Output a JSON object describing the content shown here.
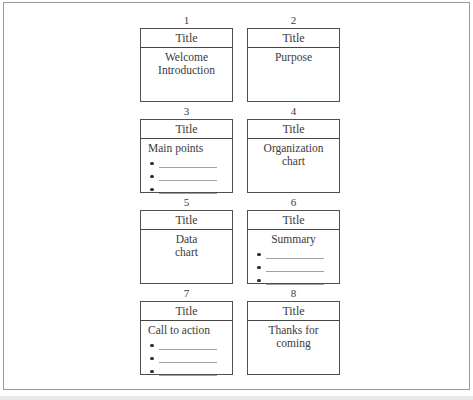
{
  "figure": {
    "slides": [
      {
        "number": "1",
        "title_label": "Title",
        "body_lines": [
          "Welcome",
          "Introduction"
        ],
        "body_align": "center",
        "bullet_count": 0
      },
      {
        "number": "2",
        "title_label": "Title",
        "body_lines": [
          "Purpose"
        ],
        "body_align": "center",
        "bullet_count": 0
      },
      {
        "number": "3",
        "title_label": "Title",
        "body_lines": [
          "Main points"
        ],
        "body_align": "left",
        "bullet_count": 3
      },
      {
        "number": "4",
        "title_label": "Title",
        "body_lines": [
          "Organization",
          "chart"
        ],
        "body_align": "center",
        "bullet_count": 0
      },
      {
        "number": "5",
        "title_label": "Title",
        "body_lines": [
          "Data",
          "chart"
        ],
        "body_align": "center",
        "bullet_count": 0
      },
      {
        "number": "6",
        "title_label": "Title",
        "body_lines": [
          "Summary"
        ],
        "body_align": "center",
        "bullet_count": 3
      },
      {
        "number": "7",
        "title_label": "Title",
        "body_lines": [
          "Call to action"
        ],
        "body_align": "left",
        "bullet_count": 3
      },
      {
        "number": "8",
        "title_label": "Title",
        "body_lines": [
          "Thanks for",
          "coming"
        ],
        "body_align": "center",
        "bullet_count": 0
      }
    ],
    "icons": {
      "bullet": "•"
    },
    "colors": {
      "background": "#ffffff",
      "frame_border": "#9a9a9a",
      "box_border": "#4e4e4e",
      "text": "#3b3b3b",
      "blank_line": "#a0a0a0",
      "page_edge": "#e8e8e8"
    }
  }
}
